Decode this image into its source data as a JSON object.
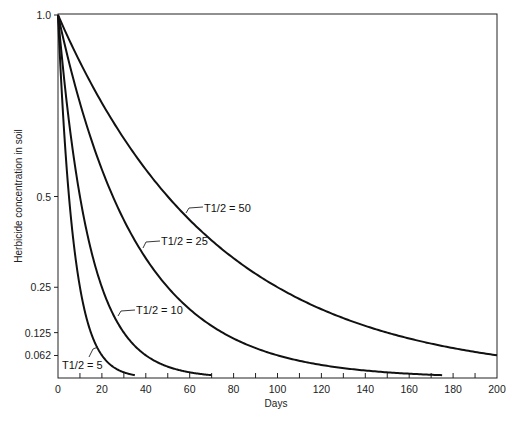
{
  "chart_data": {
    "type": "line",
    "title": "",
    "xlabel": "Days",
    "ylabel": "Herbicide concentration in soil",
    "xlim": [
      0,
      200
    ],
    "ylim": [
      0,
      1.0
    ],
    "grid": false,
    "legend": "inline labels",
    "x_ticks": [
      0,
      20,
      40,
      60,
      80,
      100,
      120,
      140,
      160,
      180,
      200
    ],
    "x_minor_tick_step": 10,
    "y_ticks": [
      {
        "value": 1.0,
        "label": "1.0"
      },
      {
        "value": 0.5,
        "label": "0.5"
      },
      {
        "value": 0.25,
        "label": "0.25"
      },
      {
        "value": 0.125,
        "label": "0.125"
      },
      {
        "value": 0.062,
        "label": "0.062"
      }
    ],
    "series": [
      {
        "name": "T1/2 = 5",
        "half_life": 5,
        "x_end": 35,
        "x": [
          0,
          5,
          10,
          15,
          20,
          25,
          30,
          35
        ],
        "values": [
          1.0,
          0.5,
          0.25,
          0.125,
          0.0625,
          0.031,
          0.016,
          0.008
        ],
        "label": {
          "text": "T1/2 = 5",
          "x": 62,
          "y": 369,
          "leader": [
            [
              89,
              357
            ],
            [
              93,
              349
            ],
            [
              98,
              347
            ]
          ]
        }
      },
      {
        "name": "T1/2 = 10",
        "half_life": 10,
        "x_end": 70,
        "x": [
          0,
          10,
          20,
          30,
          40,
          50,
          60,
          70
        ],
        "values": [
          1.0,
          0.5,
          0.25,
          0.125,
          0.0625,
          0.031,
          0.016,
          0.008
        ],
        "label": {
          "text": "T1/2 = 10",
          "x": 136,
          "y": 314,
          "leader": [
            [
              118,
              316
            ],
            [
              121,
              311
            ],
            [
              135,
              310
            ]
          ]
        }
      },
      {
        "name": "T1/2 = 25",
        "half_life": 25,
        "x_end": 175,
        "x": [
          0,
          25,
          50,
          75,
          100,
          125,
          150,
          175
        ],
        "values": [
          1.0,
          0.5,
          0.25,
          0.125,
          0.0625,
          0.031,
          0.016,
          0.008
        ],
        "label": {
          "text": "T1/2 = 25",
          "x": 161,
          "y": 245,
          "leader": [
            [
              143,
              248
            ],
            [
              146,
              242
            ],
            [
              160,
              241
            ]
          ]
        }
      },
      {
        "name": "T1/2 = 50",
        "half_life": 50,
        "x_end": 200,
        "x": [
          0,
          50,
          100,
          150,
          200
        ],
        "values": [
          1.0,
          0.5,
          0.25,
          0.125,
          0.0625
        ],
        "label": {
          "text": "T1/2 = 50",
          "x": 204,
          "y": 212,
          "leader": [
            [
              186,
              213
            ],
            [
              189,
              208
            ],
            [
              203,
              207
            ]
          ]
        }
      }
    ]
  }
}
